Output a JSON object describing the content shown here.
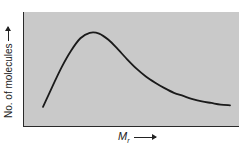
{
  "chart_data": {
    "type": "line",
    "title": "",
    "xlabel": "M_r",
    "xlabel_main": "M",
    "xlabel_sub": "r",
    "ylabel": "No. of molecules",
    "grid": false,
    "legend": null,
    "axis_arrows": true,
    "tick_labels": false,
    "series": [
      {
        "name": "distribution",
        "x": [
          0.0,
          0.05,
          0.1,
          0.15,
          0.2,
          0.25,
          0.3,
          0.35,
          0.4,
          0.45,
          0.5,
          0.55,
          0.6,
          0.65,
          0.7,
          0.75,
          0.8,
          0.85,
          0.9,
          0.95,
          1.0
        ],
        "y": [
          0.04,
          0.3,
          0.55,
          0.76,
          0.92,
          0.99,
          0.98,
          0.9,
          0.78,
          0.65,
          0.53,
          0.43,
          0.35,
          0.28,
          0.22,
          0.18,
          0.14,
          0.11,
          0.09,
          0.07,
          0.06
        ]
      }
    ],
    "colors": {
      "background": "#c9c9c9",
      "line": "#1a1a1a"
    }
  }
}
